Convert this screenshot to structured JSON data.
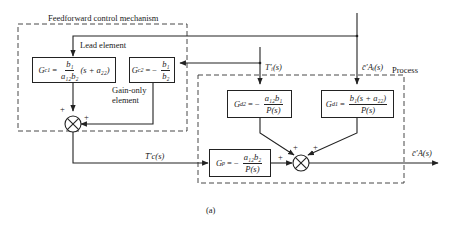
{
  "diagram": {
    "caption": "(a)",
    "regions": {
      "feedforward": {
        "title": "Feedforward control mechanism"
      },
      "process": {
        "title": "Process"
      }
    },
    "annotations": {
      "lead_element": "Lead element",
      "gain_only_line1": "Gain-only",
      "gain_only_line2": "element"
    },
    "blocks": {
      "gc1": {
        "lhs": "G",
        "sub": "c1",
        "eq": "=",
        "num": "b₁",
        "den": "a₁₂b₂",
        "tail": "(s + a₂₂)"
      },
      "gc2": {
        "lhs": "G",
        "sub": "c2",
        "eq": "= −",
        "num": "b₁",
        "den": "b₂"
      },
      "gd2": {
        "lhs": "G",
        "sub": "d2",
        "eq": "= −",
        "num": "a₁₂b₁",
        "den": "P(s)"
      },
      "gd1": {
        "lhs": "G",
        "sub": "d1",
        "eq": "=",
        "num": "b₁(s + a₂₂)",
        "den": "P(s)"
      },
      "gp": {
        "lhs": "G",
        "sub": "p",
        "eq": "= −",
        "num": "a₁₂b₂",
        "den": "P(s)"
      }
    },
    "signals": {
      "ti": "T′ᵢ(s)",
      "cai": "c̄′Aᵢ(s)",
      "tc": "T̄′c(s)",
      "ca": "c̄′A(s)"
    },
    "signs": {
      "sum1_top": "+",
      "sum1_right": "+",
      "sum2_gp": "+",
      "sum2_gd2": "+",
      "sum2_gd1": "+"
    }
  }
}
